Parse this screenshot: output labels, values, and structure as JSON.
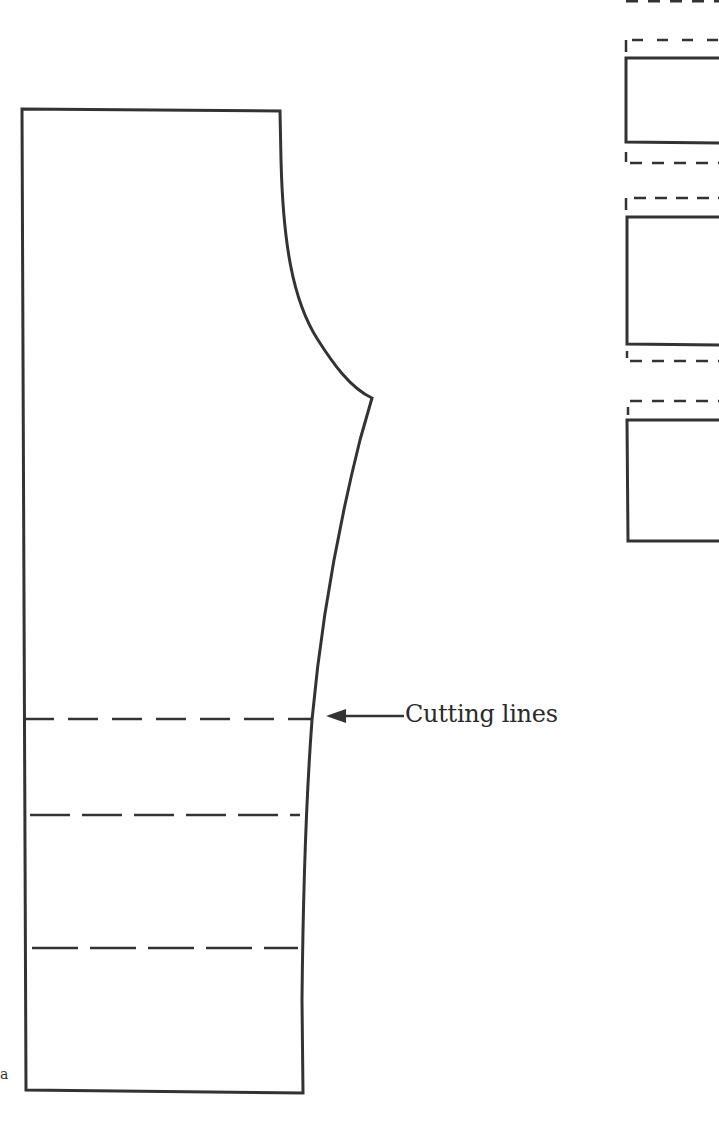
{
  "diagram": {
    "type": "sewing-pattern",
    "stroke_color": "#333333",
    "annotation": {
      "label": "Cutting lines",
      "arrow_direction": "left"
    },
    "main_piece": {
      "name": "pants-leg-pattern",
      "cutting_lines_count": 3
    },
    "cut_sections": {
      "count": 3,
      "seam_allowance_style": "dashed"
    },
    "margin_mark": "a"
  }
}
